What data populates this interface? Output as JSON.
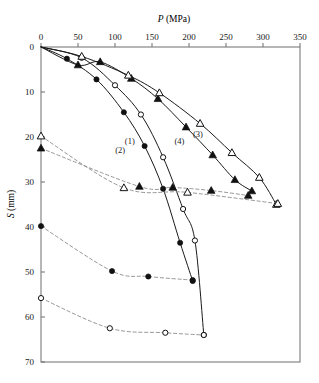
{
  "chart_data": {
    "type": "line",
    "title": "",
    "xlabel": "P (MPa)",
    "ylabel": "S (mm)",
    "xlabel_symbol": "P",
    "xlabel_unit": "(MPa)",
    "ylabel_symbol": "S",
    "ylabel_unit": "(mm)",
    "xlim": [
      0,
      350
    ],
    "ylim": [
      0,
      70
    ],
    "y_inverted": true,
    "x_axis_position": "top",
    "grid": false,
    "legend": "none",
    "xticks": [
      0,
      50,
      100,
      150,
      200,
      250,
      300,
      350
    ],
    "xticklabels": [
      "0",
      "50",
      "100",
      "150",
      "200",
      "250",
      "300",
      "350"
    ],
    "yticks": [
      0,
      10,
      20,
      30,
      40,
      50,
      60,
      70
    ],
    "yticklabels": [
      "0",
      "10",
      "20",
      "30",
      "40",
      "50",
      "60",
      "70"
    ],
    "annotations": [
      {
        "text": "(1)",
        "x": 120,
        "y": 21.5
      },
      {
        "text": "(2)",
        "x": 107,
        "y": 23.5
      },
      {
        "text": "(3)",
        "x": 212,
        "y": 20.0
      },
      {
        "text": "(4)",
        "x": 187,
        "y": 21.5
      }
    ],
    "series": [
      {
        "name": "(2)",
        "label": "(2)",
        "marker": "filled-circle",
        "line": "solid",
        "x": [
          0,
          35,
          75,
          112,
          140,
          165,
          188,
          205
        ],
        "y": [
          0,
          2.6,
          7.2,
          14.5,
          22.0,
          31.5,
          43.5,
          52.0
        ]
      },
      {
        "name": "(1)",
        "label": "(1)",
        "marker": "open-circle",
        "line": "solid",
        "x": [
          0,
          55,
          100,
          135,
          165,
          192,
          208,
          220
        ],
        "y": [
          0,
          2.4,
          8.5,
          15.0,
          24.5,
          36.0,
          43.0,
          64.0
        ]
      },
      {
        "name": "(4)",
        "label": "(4)",
        "marker": "filled-triangle",
        "line": "solid",
        "x": [
          0,
          50,
          80,
          122,
          158,
          196,
          232,
          262,
          285
        ],
        "y": [
          0,
          4.0,
          3.3,
          7.0,
          11.5,
          17.8,
          24.0,
          29.5,
          32.0
        ]
      },
      {
        "name": "(3)",
        "label": "(3)",
        "marker": "open-triangle",
        "line": "solid",
        "x": [
          0,
          55,
          118,
          160,
          215,
          258,
          295,
          318
        ],
        "y": [
          0,
          2.1,
          6.3,
          10.2,
          17.0,
          23.5,
          29.0,
          35.0
        ]
      },
      {
        "name": "dashed-open-triangle",
        "marker": "open-triangle",
        "line": "dashed",
        "x": [
          0,
          112,
          198,
          320
        ],
        "y": [
          19.8,
          31.3,
          32.3,
          34.8
        ]
      },
      {
        "name": "dashed-filled-triangle",
        "marker": "filled-triangle",
        "line": "dashed",
        "x": [
          0,
          133,
          178,
          230,
          280
        ],
        "y": [
          22.5,
          31.0,
          31.2,
          31.9,
          33.0
        ]
      },
      {
        "name": "dashed-filled-circle",
        "marker": "filled-circle",
        "line": "dashed",
        "x": [
          0,
          96,
          145,
          205
        ],
        "y": [
          39.8,
          49.8,
          51.0,
          51.8
        ]
      },
      {
        "name": "dashed-open-circle",
        "marker": "open-circle",
        "line": "dashed",
        "x": [
          0,
          93,
          168,
          220
        ],
        "y": [
          55.8,
          62.5,
          63.5,
          64.0
        ]
      }
    ]
  },
  "colors": {
    "frame": "#6e6e6e",
    "line": "#1a1a1a",
    "dashed": "#8a8a8a",
    "text": "#1a1a1a",
    "background": "#ffffff"
  }
}
